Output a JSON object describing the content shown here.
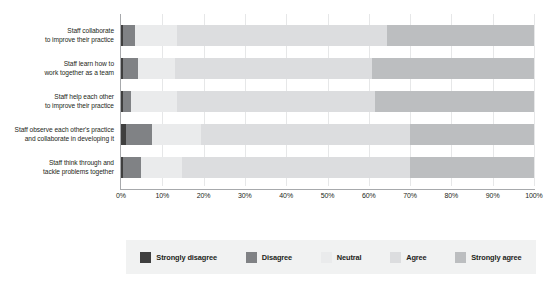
{
  "chart_data": {
    "type": "bar",
    "orientation": "horizontal",
    "stacked": true,
    "stack_mode": "percent",
    "title": "",
    "xlabel": "",
    "ylabel": "",
    "xlim": [
      0,
      100
    ],
    "grid": true,
    "legend_position": "bottom",
    "xtick_labels": [
      "0%",
      "10%",
      "20%",
      "30%",
      "40%",
      "50%",
      "60%",
      "70%",
      "80%",
      "90%",
      "100%"
    ],
    "xtick_values": [
      0,
      10,
      20,
      30,
      40,
      50,
      60,
      70,
      80,
      90,
      100
    ],
    "categories": [
      "Staff collaborate\nto improve their practice",
      "Staff learn how to\nwork together as a team",
      "Staff help each other\nto improve their practice",
      "Staff observe each other's practice\nand collaborate in developing it",
      "Staff think through and\ntackle problems together"
    ],
    "category_lines": [
      [
        "Staff collaborate",
        "to improve their practice"
      ],
      [
        "Staff learn how to",
        "work together as a team"
      ],
      [
        "Staff help each other",
        "to improve their practice"
      ],
      [
        "Staff observe each other's practice",
        "and collaborate in developing it"
      ],
      [
        "Staff think through and",
        "tackle problems together"
      ]
    ],
    "series": [
      {
        "name": "Strongly disagree",
        "color": "#3f3f3f",
        "values": [
          0.4,
          0.6,
          0.5,
          1.2,
          0.6
        ]
      },
      {
        "name": "Disagree",
        "color": "#808285",
        "values": [
          3.0,
          3.6,
          1.9,
          6.3,
          4.3
        ]
      },
      {
        "name": "Neutral",
        "color": "#eaebec",
        "values": [
          10.1,
          8.9,
          11.1,
          11.9,
          9.9
        ]
      },
      {
        "name": "Agree",
        "color": "#dcdddf",
        "values": [
          50.9,
          47.6,
          48.0,
          50.6,
          55.2
        ]
      },
      {
        "name": "Strongly agree",
        "color": "#bcbec0",
        "values": [
          35.6,
          39.3,
          38.5,
          30.0,
          30.0
        ]
      }
    ],
    "legend_entries": [
      {
        "label": "Strongly disagree",
        "color": "#3f3f3f"
      },
      {
        "label": "Disagree",
        "color": "#808285"
      },
      {
        "label": "Neutral",
        "color": "#eaebec"
      },
      {
        "label": "Agree",
        "color": "#dcdddf"
      },
      {
        "label": "Strongly agree",
        "color": "#bcbec0"
      }
    ]
  }
}
